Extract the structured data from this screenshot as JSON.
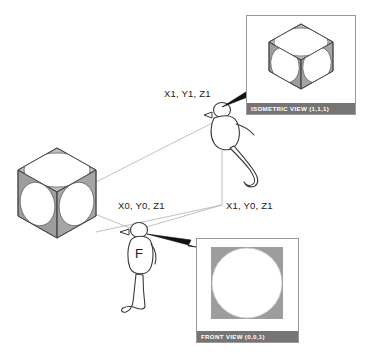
{
  "diagram": {
    "background_color": "#ffffff",
    "line_color": "#9a9a9a",
    "arrow_color": "#1a1a1a",
    "cube_face_fill": "#9d9d9d",
    "cube_top_fill": "#bdbdbd",
    "cube_edge_color": "#4a4a4a",
    "ellipse_fill": "#ffffff",
    "caption_bar_color": "#757575",
    "caption_text_color": "#ffffff",
    "panel_border_color": "#9a9a9a"
  },
  "coordinate_labels": [
    {
      "id": "iso-viewpoint",
      "text": "X1, Y1, Z1",
      "x": 164,
      "y": 88
    },
    {
      "id": "front-viewpoint",
      "text": "X0, Y0, Z1",
      "x": 118,
      "y": 200
    },
    {
      "id": "ground-reference",
      "text": "X1, Y0, Z1",
      "x": 226,
      "y": 200
    }
  ],
  "object": {
    "name": "sphere-in-cube-object",
    "description": "Cube with inscribed circles on each visible face"
  },
  "figures": [
    {
      "id": "isometric-observer",
      "letter": "",
      "label": "elevated observer at X1, Y1, Z1"
    },
    {
      "id": "front-observer",
      "letter": "F",
      "label": "ground observer at X0, Y0, Z1"
    }
  ],
  "panels": [
    {
      "id": "isometric-view-panel",
      "caption": "ISOMETRIC  VIEW (1,1,1)",
      "content": "cube-with-three-ellipses",
      "x": 246,
      "y": 15,
      "width": 110,
      "height": 100
    },
    {
      "id": "front-view-panel",
      "caption": "FRONT VIEW (0,0,1)",
      "content": "square-with-circle",
      "x": 196,
      "y": 238,
      "width": 103,
      "height": 105
    }
  ]
}
